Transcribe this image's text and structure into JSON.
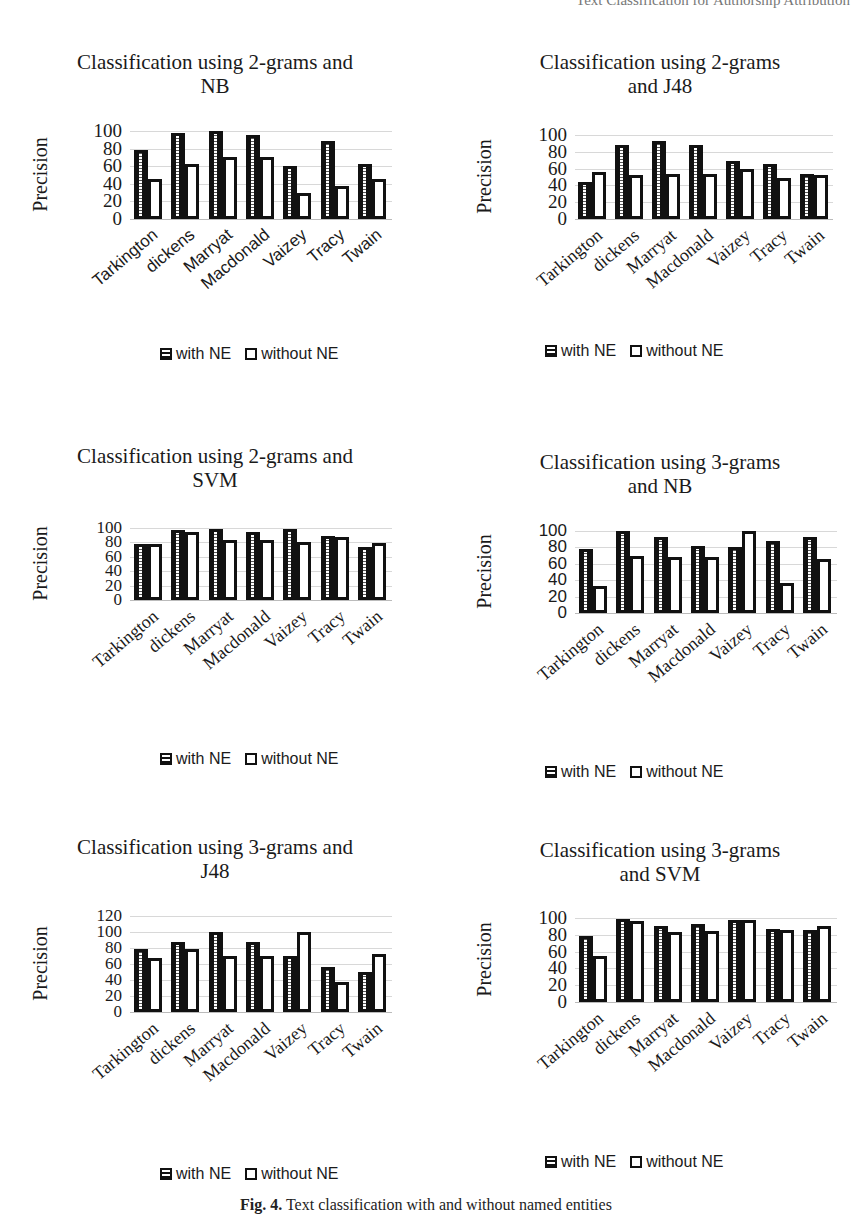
{
  "page": {
    "running_head": "Text Classification for Authorship Attribution",
    "caption_label": "Fig. 4.",
    "caption_text": "Text classification with and without named entities"
  },
  "legend": {
    "with_label": "with NE",
    "without_label": "without NE",
    "with_icon": "dotted-fill-swatch",
    "without_icon": "empty-swatch"
  },
  "chart_data": [
    {
      "type": "bar",
      "title_line1": "Classification using 2-grams and",
      "title_line2": "NB",
      "xlabel": "",
      "ylabel": "Precision",
      "ylim": [
        0,
        100
      ],
      "yticks": [
        0,
        20,
        40,
        60,
        80,
        100
      ],
      "grid": true,
      "legend_position": "bottom",
      "categories": [
        "Tarkington",
        "dickens",
        "Marryat",
        "Macdonald",
        "Vaizey",
        "Tracy",
        "Twain"
      ],
      "series": [
        {
          "name": "with NE",
          "values": [
            78,
            98,
            100,
            95,
            60,
            89,
            62
          ]
        },
        {
          "name": "without NE",
          "values": [
            45,
            62,
            70,
            70,
            30,
            37,
            46
          ]
        }
      ]
    },
    {
      "type": "bar",
      "title_line1": "Classification using 2-grams",
      "title_line2": "and J48",
      "xlabel": "",
      "ylabel": "Precision",
      "ylim": [
        0,
        100
      ],
      "yticks": [
        0,
        20,
        40,
        60,
        80,
        100
      ],
      "grid": true,
      "legend_position": "bottom",
      "categories": [
        "Tarkington",
        "dickens",
        "Marryat",
        "Macdonald",
        "Vaizey",
        "Tracy",
        "Twain"
      ],
      "series": [
        {
          "name": "with NE",
          "values": [
            44,
            88,
            93,
            88,
            69,
            65,
            54
          ]
        },
        {
          "name": "without NE",
          "values": [
            56,
            52,
            54,
            54,
            59,
            49,
            52
          ]
        }
      ]
    },
    {
      "type": "bar",
      "title_line1": "Classification using 2-grams and",
      "title_line2": "SVM",
      "xlabel": "",
      "ylabel": "Precision",
      "ylim": [
        0,
        100
      ],
      "yticks": [
        0,
        20,
        40,
        60,
        80,
        100
      ],
      "grid": true,
      "legend_position": "bottom",
      "categories": [
        "Tarkington",
        "dickens",
        "Marryat",
        "Macdonald",
        "Vaizey",
        "Tracy",
        "Twain"
      ],
      "series": [
        {
          "name": "with NE",
          "values": [
            78,
            97,
            99,
            95,
            99,
            89,
            74
          ]
        },
        {
          "name": "without NE",
          "values": [
            78,
            94,
            84,
            84,
            80,
            88,
            79
          ]
        }
      ]
    },
    {
      "type": "bar",
      "title_line1": "Classification using 3-grams",
      "title_line2": "and NB",
      "xlabel": "",
      "ylabel": "Precision",
      "ylim": [
        0,
        100
      ],
      "yticks": [
        0,
        20,
        40,
        60,
        80,
        100
      ],
      "grid": true,
      "legend_position": "bottom",
      "categories": [
        "Tarkington",
        "dickens",
        "Marryat",
        "Macdonald",
        "Vaizey",
        "Tracy",
        "Twain"
      ],
      "series": [
        {
          "name": "with NE",
          "values": [
            78,
            100,
            93,
            82,
            80,
            88,
            93
          ]
        },
        {
          "name": "without NE",
          "values": [
            33,
            70,
            68,
            68,
            100,
            37,
            66
          ]
        }
      ]
    },
    {
      "type": "bar",
      "title_line1": "Classification using 3-grams and",
      "title_line2": "J48",
      "xlabel": "",
      "ylabel": "Precision",
      "ylim": [
        0,
        120
      ],
      "yticks": [
        0,
        20,
        40,
        60,
        80,
        100,
        120
      ],
      "grid": true,
      "legend_position": "bottom",
      "categories": [
        "Tarkington",
        "dickens",
        "Marryat",
        "Macdonald",
        "Vaizey",
        "Tracy",
        "Twain"
      ],
      "series": [
        {
          "name": "with NE",
          "values": [
            79,
            87,
            100,
            88,
            70,
            56,
            50
          ]
        },
        {
          "name": "without NE",
          "values": [
            67,
            79,
            70,
            70,
            100,
            37,
            73
          ]
        }
      ]
    },
    {
      "type": "bar",
      "title_line1": "Classification using 3-grams",
      "title_line2": "and SVM",
      "xlabel": "",
      "ylabel": "Precision",
      "ylim": [
        0,
        100
      ],
      "yticks": [
        0,
        20,
        40,
        60,
        80,
        100
      ],
      "grid": true,
      "legend_position": "bottom",
      "categories": [
        "Tarkington",
        "dickens",
        "Marryat",
        "Macdonald",
        "Vaizey",
        "Tracy",
        "Twain"
      ],
      "series": [
        {
          "name": "with NE",
          "values": [
            78,
            99,
            91,
            93,
            98,
            87,
            86
          ]
        },
        {
          "name": "without NE",
          "values": [
            55,
            96,
            83,
            84,
            98,
            86,
            91
          ]
        }
      ]
    }
  ]
}
